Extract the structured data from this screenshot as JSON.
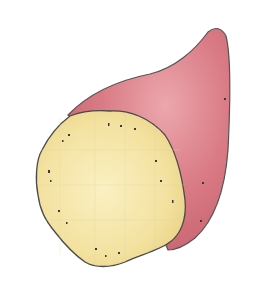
{
  "image": {
    "subject": "Watercolor illustration of a sweet potato with a cut cross-section",
    "colors": {
      "background": "#ffffff",
      "skin": "#d9727f",
      "skin_light": "#e9a0a8",
      "skin_dark": "#b9525f",
      "flesh": "#f3e3a0",
      "flesh_light": "#f8eec0",
      "outline": "#4a4a4a",
      "speckle": "#3a3a3a"
    }
  }
}
